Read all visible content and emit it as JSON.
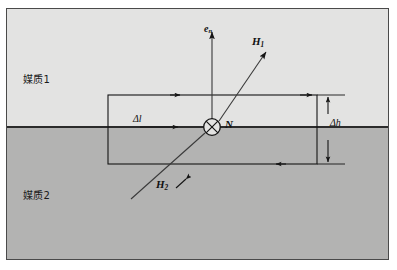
{
  "figure": {
    "type": "physics-diagram",
    "regions": {
      "upper_label": "媒质1",
      "lower_label": "媒质2",
      "upper_color": "#e3e3e2",
      "lower_color": "#b3b3b2",
      "interface_color": "#2b2b2b"
    },
    "labels": {
      "normal_vector": "e",
      "normal_vector_sub": "n",
      "field_upper": "H",
      "field_upper_sub": "1",
      "field_lower": "H",
      "field_lower_sub": "2",
      "surface_normal": "N",
      "length_symbol": "Δl",
      "height_symbol": "Δh"
    },
    "geometry": {
      "frame": {
        "x": 6,
        "y": 8,
        "width": 383,
        "height": 252
      },
      "interface_y": 126,
      "loop": {
        "left": 108,
        "right": 317,
        "top": 95,
        "bottom": 164
      },
      "center": {
        "x": 212,
        "y": 127
      },
      "en_arrow_tip": {
        "x": 212,
        "y": 30
      },
      "h1_arrow_tip": {
        "x": 266,
        "y": 52
      },
      "h2_line_start": {
        "x": 131,
        "y": 199
      },
      "dim_line_x": 328
    },
    "stroke_color": "#151515"
  }
}
